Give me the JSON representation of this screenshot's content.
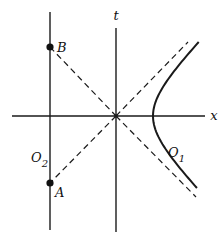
{
  "diagram": {
    "type": "spacetime-diagram",
    "colors": {
      "stroke": "#1a1a1a",
      "background": "#ffffff"
    },
    "axes": {
      "x": {
        "label": "x",
        "from": [
          12,
          116
        ],
        "to": [
          205,
          116
        ],
        "label_pos": [
          214,
          120
        ]
      },
      "t": {
        "label": "t",
        "from": [
          116,
          28
        ],
        "to": [
          116,
          232
        ],
        "label_pos": [
          116,
          20
        ]
      }
    },
    "origin": [
      116,
      116
    ],
    "worldline_O2": {
      "label": "O",
      "subscript": "2",
      "from": [
        50,
        12
      ],
      "to": [
        50,
        230
      ],
      "label_pos": [
        31,
        162
      ]
    },
    "points": [
      {
        "name": "B",
        "label": "B",
        "pos": [
          50,
          47
        ],
        "label_pos": [
          57,
          52
        ]
      },
      {
        "name": "A",
        "label": "A",
        "pos": [
          50,
          183
        ],
        "label_pos": [
          55,
          197
        ]
      }
    ],
    "dashed_lines": [
      {
        "name": "B-to-origin",
        "from": [
          50,
          47
        ],
        "to": [
          116,
          116
        ]
      },
      {
        "name": "origin-to-A",
        "from": [
          116,
          116
        ],
        "to": [
          50,
          183
        ]
      },
      {
        "name": "light-cone-upper-right",
        "from": [
          116,
          116
        ],
        "to": [
          188,
          42
        ]
      },
      {
        "name": "light-cone-lower-right",
        "from": [
          116,
          116
        ],
        "to": [
          196,
          197
        ]
      }
    ],
    "hyperbola_O1": {
      "label": "O",
      "subscript": "1",
      "vertex": [
        153,
        116
      ],
      "top_end": [
        193,
        42
      ],
      "bottom_end": [
        192,
        188
      ],
      "label_pos": [
        168,
        157
      ]
    }
  }
}
